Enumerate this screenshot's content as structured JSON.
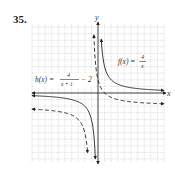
{
  "problem_number": "35.",
  "chart_data": {
    "type": "line",
    "title": "",
    "xlabel": "x",
    "ylabel": "y",
    "xlim": [
      -10,
      10
    ],
    "ylim": [
      -10,
      10
    ],
    "grid": true,
    "series": [
      {
        "name": "f(x) = 4/x",
        "style": "solid",
        "expr": "4/x",
        "asymptotes": {
          "vertical": 0,
          "horizontal": 0
        }
      },
      {
        "name": "h(x) = 4/(x+1) - 2",
        "style": "dashed",
        "expr": "4/(x+1)-2",
        "asymptotes": {
          "vertical": -1,
          "horizontal": -2
        }
      }
    ],
    "annotations": [
      {
        "text": "f(x) = 4/x",
        "position": "upper right"
      },
      {
        "text": "h(x) = 4/(x+1) − 2",
        "position": "upper left near y-axis"
      }
    ]
  },
  "labels": {
    "x_axis": "x",
    "y_axis": "y",
    "f_name": "f(x) =",
    "f_num": "4",
    "f_den": "x",
    "h_name": "h(x) =",
    "h_num": "4",
    "h_den": "x + 1",
    "h_tail": "− 2"
  }
}
